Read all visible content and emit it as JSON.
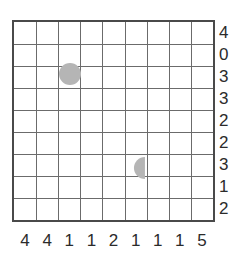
{
  "puzzle": {
    "type": "nonogram-like-grid-puzzle",
    "grid": {
      "columns": 9,
      "rows": 9,
      "cell_size": 22.3,
      "origin_x": 12,
      "origin_y": 20,
      "line_color": "#6b6b6b",
      "border_color": "#4a4a4a",
      "background_color": "#ffffff"
    },
    "row_labels": [
      "4",
      "0",
      "3",
      "3",
      "2",
      "2",
      "3",
      "1",
      "2"
    ],
    "column_labels": [
      "4",
      "4",
      "1",
      "1",
      "2",
      "1",
      "1",
      "1",
      "5"
    ],
    "label_color": "#2b2b2b",
    "shapes": [
      {
        "name": "circle-marker",
        "kind": "circle",
        "column": 3,
        "row": 3,
        "center_x": 70,
        "center_y": 74,
        "radius": 11,
        "fill": "#b5b5b5"
      },
      {
        "name": "half-circle-marker",
        "kind": "half-circle-flat-right",
        "column": 6,
        "row": 7,
        "center_x": 140,
        "center_y": 168,
        "radius": 11,
        "fill": "#b5b5b5"
      }
    ]
  }
}
